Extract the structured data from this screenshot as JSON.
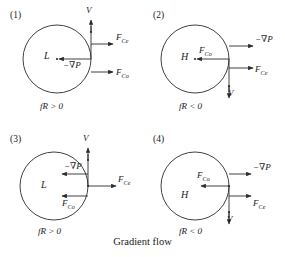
{
  "figure": {
    "caption": "Gradient flow",
    "stroke_color": "#2b2b2b",
    "text_color": "#1a1a1a",
    "background": "#ffffff"
  },
  "symbols": {
    "velocity": "V",
    "pressure_gradient": "−∇P",
    "centrifugal": "F",
    "centrifugal_sub": "Ce",
    "coriolis": "F",
    "coriolis_sub": "Co"
  },
  "panels": [
    {
      "number": "(1)",
      "center_label": "L",
      "condition": "fR > 0",
      "velocity_label": "V",
      "velocity_direction": "up",
      "pressure_gradient_label": "−∇P",
      "pressure_gradient_direction": "left",
      "centrifugal_label": "F",
      "centrifugal_sub": "Ce",
      "centrifugal_direction": "right",
      "coriolis_label": "F",
      "coriolis_sub": "Co",
      "coriolis_direction": "right"
    },
    {
      "number": "(2)",
      "center_label": "H",
      "condition": "fR < 0",
      "velocity_label": "V",
      "velocity_direction": "down",
      "pressure_gradient_label": "−∇P",
      "pressure_gradient_direction": "right",
      "centrifugal_label": "F",
      "centrifugal_sub": "Ce",
      "centrifugal_direction": "right",
      "coriolis_label": "F",
      "coriolis_sub": "Co",
      "coriolis_direction": "left"
    },
    {
      "number": "(3)",
      "center_label": "L",
      "condition": "fR > 0",
      "velocity_label": "V",
      "velocity_direction": "up",
      "pressure_gradient_label": "−∇P",
      "pressure_gradient_direction": "left",
      "centrifugal_label": "F",
      "centrifugal_sub": "Ce",
      "centrifugal_direction": "right",
      "coriolis_label": "F",
      "coriolis_sub": "Co",
      "coriolis_direction": "left"
    },
    {
      "number": "(4)",
      "center_label": "H",
      "condition": "fR < 0",
      "velocity_label": "V",
      "velocity_direction": "down",
      "pressure_gradient_label": "−∇P",
      "pressure_gradient_direction": "right",
      "centrifugal_label": "F",
      "centrifugal_sub": "Ce",
      "centrifugal_direction": "right",
      "coriolis_label": "F",
      "coriolis_sub": "Co",
      "coriolis_direction": "left"
    }
  ]
}
